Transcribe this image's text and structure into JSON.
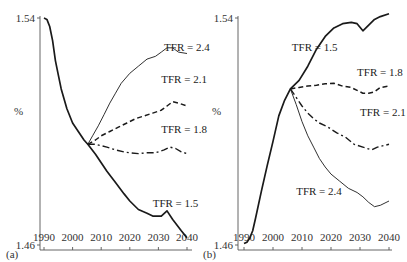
{
  "chart_data": [
    {
      "type": "line",
      "panel": "(a)",
      "title": "",
      "xlabel": "",
      "ylabel": "%",
      "xlim": [
        1990,
        2040
      ],
      "ylim": [
        1.46,
        1.54
      ],
      "x_ticks": [
        "1990",
        "2000",
        "2010",
        "2020",
        "2030",
        "2040"
      ],
      "y_ticks": [
        "1.46",
        "1.54"
      ],
      "grid": false,
      "legend": "inline labels",
      "series": [
        {
          "name": "TFR = 1.5",
          "style": "solid-thick",
          "label_pos": [
            2028,
            1.4735
          ],
          "points": [
            [
              1990,
              1.54
            ],
            [
              1991,
              1.5395
            ],
            [
              1992,
              1.537
            ],
            [
              1993,
              1.532
            ],
            [
              1994,
              1.525
            ],
            [
              1995,
              1.52
            ],
            [
              1996,
              1.515
            ],
            [
              1998,
              1.508
            ],
            [
              2000,
              1.503
            ],
            [
              2002,
              1.5
            ],
            [
              2004,
              1.497
            ],
            [
              2005.3,
              1.4955
            ],
            [
              2008,
              1.492
            ],
            [
              2010,
              1.489
            ],
            [
              2012,
              1.486
            ],
            [
              2015,
              1.482
            ],
            [
              2018,
              1.478
            ],
            [
              2020,
              1.4755
            ],
            [
              2023,
              1.4725
            ],
            [
              2026,
              1.4712
            ],
            [
              2028,
              1.4702
            ],
            [
              2031,
              1.4702
            ],
            [
              2033,
              1.472
            ],
            [
              2035,
              1.469
            ],
            [
              2038,
              1.465
            ],
            [
              2040,
              1.4625
            ]
          ]
        },
        {
          "name": "TFR = 1.8",
          "style": "dash-dot",
          "label_pos": [
            2031,
            1.4995
          ],
          "points": [
            [
              2005.3,
              1.4955
            ],
            [
              2008,
              1.4955
            ],
            [
              2010,
              1.495
            ],
            [
              2012,
              1.4945
            ],
            [
              2015,
              1.4935
            ],
            [
              2018,
              1.4928
            ],
            [
              2020,
              1.4925
            ],
            [
              2023,
              1.4922
            ],
            [
              2026,
              1.4925
            ],
            [
              2029,
              1.4925
            ],
            [
              2032,
              1.4935
            ],
            [
              2034,
              1.4945
            ],
            [
              2036,
              1.494
            ],
            [
              2038,
              1.4928
            ],
            [
              2040,
              1.4922
            ]
          ]
        },
        {
          "name": "TFR = 2.1",
          "style": "dashed",
          "label_pos": [
            2031,
            1.517
          ],
          "points": [
            [
              2005.3,
              1.4955
            ],
            [
              2008,
              1.497
            ],
            [
              2010,
              1.4985
            ],
            [
              2013,
              1.5
            ],
            [
              2016,
              1.5015
            ],
            [
              2019,
              1.503
            ],
            [
              2022,
              1.5045
            ],
            [
              2025,
              1.5055
            ],
            [
              2028,
              1.5065
            ],
            [
              2031,
              1.5075
            ],
            [
              2033,
              1.509
            ],
            [
              2035,
              1.5105
            ],
            [
              2037,
              1.51
            ],
            [
              2040,
              1.509
            ]
          ]
        },
        {
          "name": "TFR = 2.4",
          "style": "solid-thin",
          "label_pos": [
            2032,
            1.5285
          ],
          "points": [
            [
              2005.3,
              1.4955
            ],
            [
              2007,
              1.4985
            ],
            [
              2009,
              1.502
            ],
            [
              2011,
              1.506
            ],
            [
              2013,
              1.51
            ],
            [
              2015,
              1.5135
            ],
            [
              2017,
              1.517
            ],
            [
              2020,
              1.5205
            ],
            [
              2023,
              1.523
            ],
            [
              2026,
              1.5255
            ],
            [
              2029,
              1.5265
            ],
            [
              2031,
              1.528
            ],
            [
              2033,
              1.5295
            ],
            [
              2035,
              1.5295
            ],
            [
              2037,
              1.528
            ],
            [
              2040,
              1.5275
            ]
          ]
        }
      ]
    },
    {
      "type": "line",
      "panel": "(b)",
      "title": "",
      "xlabel": "",
      "ylabel": "%",
      "xlim": [
        1990,
        2040
      ],
      "ylim": [
        1.46,
        1.54
      ],
      "x_ticks": [
        "1990",
        "2000",
        "2010",
        "2020",
        "2030",
        "2040"
      ],
      "y_ticks": [
        "1.46",
        "1.54"
      ],
      "grid": false,
      "legend": "inline labels",
      "series": [
        {
          "name": "TFR = 1.5",
          "style": "solid-thick",
          "label_pos": [
            2006.5,
            1.5285
          ],
          "points": [
            [
              1990,
              1.4605
            ],
            [
              1991,
              1.461
            ],
            [
              1992,
              1.4625
            ],
            [
              1993,
              1.465
            ],
            [
              1994,
              1.4695
            ],
            [
              1996,
              1.479
            ],
            [
              1998,
              1.488
            ],
            [
              2000,
              1.4965
            ],
            [
              2002,
              1.5055
            ],
            [
              2004,
              1.511
            ],
            [
              2006,
              1.515
            ],
            [
              2009,
              1.518
            ],
            [
              2012,
              1.523
            ],
            [
              2015,
              1.529
            ],
            [
              2018,
              1.5335
            ],
            [
              2021,
              1.5365
            ],
            [
              2024,
              1.538
            ],
            [
              2027,
              1.5385
            ],
            [
              2029,
              1.538
            ],
            [
              2031,
              1.5355
            ],
            [
              2033,
              1.5375
            ],
            [
              2035,
              1.5395
            ],
            [
              2037,
              1.5405
            ],
            [
              2040,
              1.5415
            ]
          ]
        },
        {
          "name": "TFR = 1.8",
          "style": "dashed",
          "label_pos": [
            2029,
            1.5195
          ],
          "points": [
            [
              2006,
              1.515
            ],
            [
              2009,
              1.5155
            ],
            [
              2012,
              1.516
            ],
            [
              2015,
              1.5163
            ],
            [
              2018,
              1.5168
            ],
            [
              2021,
              1.517
            ],
            [
              2024,
              1.516
            ],
            [
              2027,
              1.5155
            ],
            [
              2029,
              1.5145
            ],
            [
              2031,
              1.5135
            ],
            [
              2033,
              1.5135
            ],
            [
              2035,
              1.514
            ],
            [
              2037,
              1.5155
            ],
            [
              2040,
              1.516
            ]
          ]
        },
        {
          "name": "TFR = 2.1",
          "style": "dash-dot",
          "label_pos": [
            2030,
            1.5055
          ],
          "points": [
            [
              2006,
              1.515
            ],
            [
              2008,
              1.512
            ],
            [
              2010,
              1.509
            ],
            [
              2012,
              1.5065
            ],
            [
              2014,
              1.5045
            ],
            [
              2016,
              1.503
            ],
            [
              2019,
              1.5015
            ],
            [
              2022,
              1.4995
            ],
            [
              2025,
              1.498
            ],
            [
              2028,
              1.4955
            ],
            [
              2031,
              1.4945
            ],
            [
              2034,
              1.4935
            ],
            [
              2036,
              1.4945
            ],
            [
              2040,
              1.4955
            ]
          ]
        },
        {
          "name": "TFR = 2.4",
          "style": "solid-thin",
          "label_pos": [
            2008,
            1.4775
          ],
          "points": [
            [
              2006,
              1.515
            ],
            [
              2008,
              1.5095
            ],
            [
              2010,
              1.5035
            ],
            [
              2012,
              1.4985
            ],
            [
              2014,
              1.4945
            ],
            [
              2016,
              1.4905
            ],
            [
              2018,
              1.4875
            ],
            [
              2020,
              1.485
            ],
            [
              2023,
              1.4825
            ],
            [
              2026,
              1.48
            ],
            [
              2029,
              1.4785
            ],
            [
              2031,
              1.477
            ],
            [
              2033,
              1.475
            ],
            [
              2035,
              1.4735
            ],
            [
              2037,
              1.474
            ],
            [
              2040,
              1.4755
            ]
          ]
        }
      ]
    }
  ],
  "panels": [
    {
      "label": "(a)",
      "ylabel": "%",
      "y_top": "1.54",
      "y_bottom": "1.46"
    },
    {
      "label": "(b)",
      "ylabel": "%",
      "y_top": "1.54",
      "y_bottom": "1.46"
    }
  ]
}
